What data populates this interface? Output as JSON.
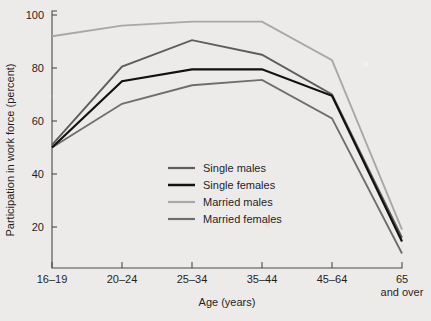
{
  "chart_data": {
    "type": "line",
    "title": "",
    "xlabel": "Age (years)",
    "ylabel": "Participation in work force (percent)",
    "categories": [
      "16–19",
      "20–24",
      "25–34",
      "35–44",
      "45–64",
      "65\nand over"
    ],
    "category_labels": [
      {
        "line1": "16–19",
        "line2": ""
      },
      {
        "line1": "20–24",
        "line2": ""
      },
      {
        "line1": "25–34",
        "line2": ""
      },
      {
        "line1": "35–44",
        "line2": ""
      },
      {
        "line1": "45–64",
        "line2": ""
      },
      {
        "line1": "65",
        "line2": "and over"
      }
    ],
    "ylim": [
      10,
      100
    ],
    "yticks": [
      20,
      40,
      60,
      80,
      100
    ],
    "ytick_labels": [
      "20",
      "40",
      "60",
      "80",
      "100"
    ],
    "grid": false,
    "legend_position": "center",
    "series": [
      {
        "name": "Single males",
        "color": "#5d5d5d",
        "width": 1.9,
        "values": [
          51,
          80.5,
          90.5,
          85,
          70,
          16
        ]
      },
      {
        "name": "Single females",
        "color": "#111111",
        "width": 2.2,
        "values": [
          50,
          75,
          79.5,
          79.5,
          69.5,
          14.5
        ]
      },
      {
        "name": "Married males",
        "color": "#a8a8a8",
        "width": 1.9,
        "values": [
          92,
          96,
          97.5,
          97.5,
          83,
          19
        ]
      },
      {
        "name": "Married females",
        "color": "#6e6e6e",
        "width": 1.9,
        "values": [
          50,
          66.5,
          73.5,
          75.5,
          61,
          10
        ]
      }
    ]
  },
  "legend": {
    "items": [
      {
        "label": "Single males"
      },
      {
        "label": "Single females"
      },
      {
        "label": "Married males"
      },
      {
        "label": "Married females"
      }
    ]
  }
}
